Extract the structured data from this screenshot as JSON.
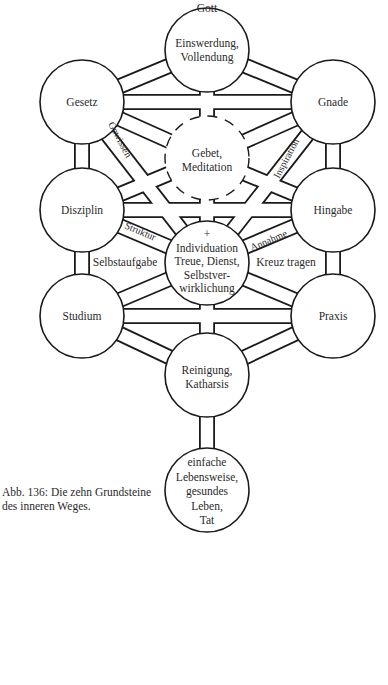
{
  "diagram": {
    "title_top": "Gott",
    "nodes": {
      "top": {
        "l1": "Einswerdung,",
        "l2": "Vollendung"
      },
      "gesetz": {
        "l1": "Gesetz"
      },
      "gnade": {
        "l1": "Gnade"
      },
      "gebet": {
        "l1": "Gebet,",
        "l2": "Meditation"
      },
      "disziplin": {
        "l1": "Disziplin"
      },
      "hingabe": {
        "l1": "Hingabe"
      },
      "center": {
        "l0": "+",
        "l1": "Individuation",
        "l2": "Treue, Dienst,",
        "l3": "Selbstver-",
        "l4": "wirklichung"
      },
      "studium": {
        "l1": "Studium"
      },
      "praxis": {
        "l1": "Praxis"
      },
      "reinigung": {
        "l1": "Reinigung,",
        "l2": "Katharsis"
      },
      "base": {
        "l1": "einfache",
        "l2": "Lebensweise,",
        "l3": "gesundes",
        "l4": "Leben,",
        "l5": "Tat"
      }
    },
    "path_labels": {
      "gewissen": "Gewissen",
      "inspiration": "Inspiration",
      "struktur": "Struktur",
      "annahme": "Annahme",
      "selbstaufgabe": "Selbstaufgabe",
      "kreuz": "Kreuz tragen"
    },
    "colors": {
      "line": "#1a1a1a",
      "background": "#ffffff",
      "text": "#2a2a2a"
    }
  },
  "caption": {
    "line1": "Abb. 136: Die zehn Grundsteine",
    "line2": "des inneren Weges."
  }
}
